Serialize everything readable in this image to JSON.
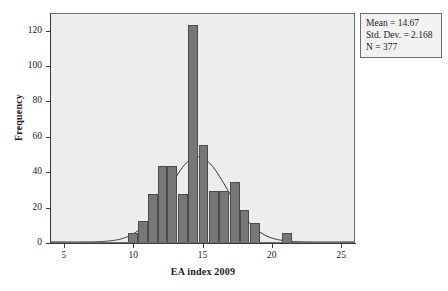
{
  "stats_box": {
    "mean_line": "Mean = 14.67",
    "std_dev_line": "Std. Dev. = 2.168",
    "n_line": "N = 377"
  },
  "chart_data": {
    "type": "bar",
    "title": "",
    "subtitle": "",
    "xlabel": "EA index 2009",
    "ylabel": "Frequency",
    "xlim": [
      4.0,
      26.0
    ],
    "ylim": [
      0,
      130
    ],
    "xticks": [
      5,
      10,
      15,
      20,
      25
    ],
    "yticks": [
      0,
      20,
      40,
      60,
      80,
      100,
      120
    ],
    "xtick_labels": [
      "5",
      "10",
      "15",
      "20",
      "25"
    ],
    "ytick_labels": [
      "0",
      "20",
      "40",
      "60",
      "80",
      "100",
      "120"
    ],
    "grid": false,
    "legend": "none",
    "bin_width": 0.7,
    "bar_color": "#777777",
    "bar_edge_color": "#4b4b4b",
    "plot_background": "#ededed",
    "curve_color": "#2b2b2b",
    "curve_type": "normal",
    "curve_mean": 14.67,
    "curve_std_dev": 2.168,
    "curve_n": 377,
    "categories": [
      7.75,
      9.8,
      10.5,
      11.2,
      11.9,
      12.6,
      13.3,
      14.0,
      14.7,
      15.4,
      16.1,
      16.8,
      17.5,
      18.2,
      18.9,
      21.0
    ],
    "values": [
      1,
      6,
      13,
      28,
      44,
      44,
      124,
      124,
      56,
      30,
      30,
      35,
      35,
      19,
      12,
      6
    ],
    "bars": [
      {
        "x_center": 7.75,
        "x_left": 7.45,
        "x_right": 8.25,
        "value": 1
      },
      {
        "x_center": 9.9,
        "x_left": 9.55,
        "x_right": 10.3,
        "value": 6
      },
      {
        "x_center": 10.6,
        "x_left": 10.3,
        "x_right": 11.0,
        "value": 13
      },
      {
        "x_center": 11.3,
        "x_left": 11.0,
        "x_right": 11.7,
        "value": 28
      },
      {
        "x_center": 12.0,
        "x_left": 11.7,
        "x_right": 12.4,
        "value": 44
      },
      {
        "x_center": 12.7,
        "x_left": 12.4,
        "x_right": 13.1,
        "value": 44
      },
      {
        "x_center": 13.5,
        "x_left": 13.15,
        "x_right": 13.85,
        "value": 28
      },
      {
        "x_center": 14.25,
        "x_left": 13.9,
        "x_right": 14.6,
        "value": 124
      },
      {
        "x_center": 15.0,
        "x_left": 14.65,
        "x_right": 15.35,
        "value": 56
      },
      {
        "x_center": 15.75,
        "x_left": 15.4,
        "x_right": 16.1,
        "value": 30
      },
      {
        "x_center": 16.5,
        "x_left": 16.15,
        "x_right": 16.85,
        "value": 30
      },
      {
        "x_center": 17.2,
        "x_left": 16.9,
        "x_right": 17.6,
        "value": 35
      },
      {
        "x_center": 17.95,
        "x_left": 17.6,
        "x_right": 18.3,
        "value": 19
      },
      {
        "x_center": 18.7,
        "x_left": 18.35,
        "x_right": 19.05,
        "value": 12
      },
      {
        "x_center": 21.0,
        "x_left": 20.65,
        "x_right": 21.35,
        "value": 6
      }
    ]
  }
}
